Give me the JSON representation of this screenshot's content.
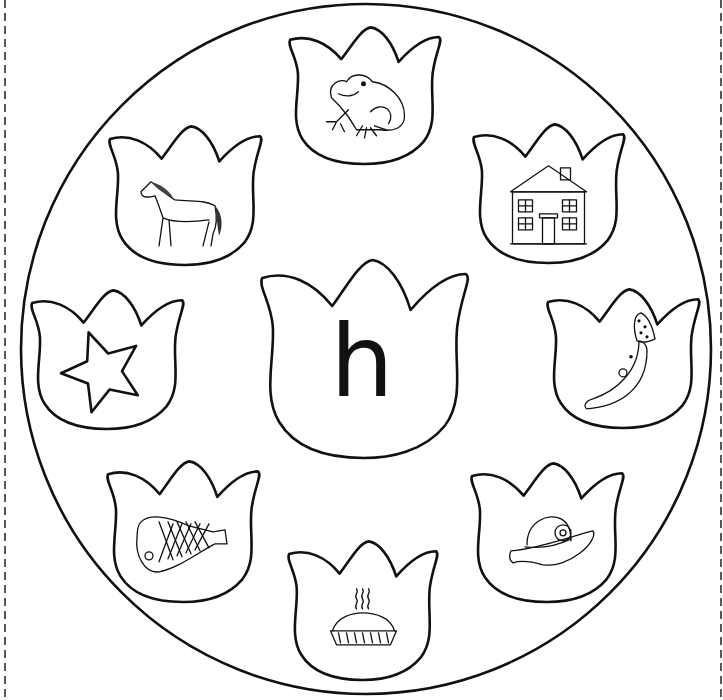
{
  "worksheet": {
    "center_letter": "h",
    "border": {
      "style": "dashed",
      "color": "#222222"
    },
    "circle": {
      "cx": 366,
      "cy": 349,
      "r": 345
    },
    "center_tulip": {
      "x": 258,
      "y": 258,
      "w": 212,
      "h": 200
    },
    "tulips": [
      {
        "id": "frog",
        "label": "frog",
        "x": 287,
        "y": 26,
        "w": 155,
        "h": 138
      },
      {
        "id": "house",
        "label": "house",
        "x": 471,
        "y": 123,
        "w": 155,
        "h": 140
      },
      {
        "id": "moon",
        "label": "moon",
        "x": 545,
        "y": 288,
        "w": 156,
        "h": 140
      },
      {
        "id": "hat",
        "label": "hat",
        "x": 469,
        "y": 462,
        "w": 156,
        "h": 140
      },
      {
        "id": "pie",
        "label": "pie",
        "x": 286,
        "y": 540,
        "w": 153,
        "h": 140
      },
      {
        "id": "ham",
        "label": "ham",
        "x": 105,
        "y": 460,
        "w": 156,
        "h": 142
      },
      {
        "id": "star",
        "label": "star",
        "x": 29,
        "y": 289,
        "w": 156,
        "h": 140
      },
      {
        "id": "horse",
        "label": "horse",
        "x": 107,
        "y": 125,
        "w": 156,
        "h": 140
      }
    ]
  }
}
